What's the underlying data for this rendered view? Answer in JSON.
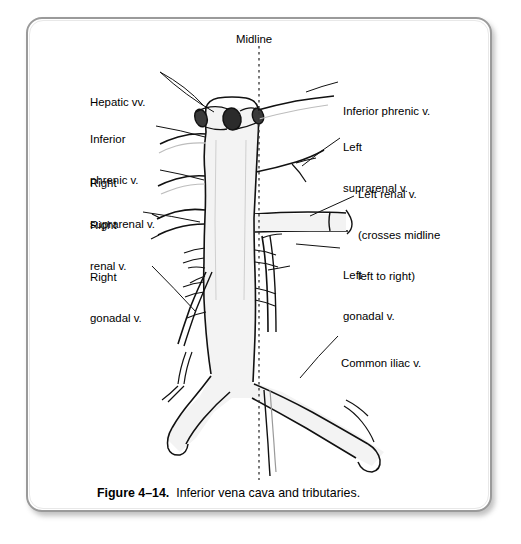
{
  "figure": {
    "caption_number": "Figure 4–14.",
    "caption_text": "Inferior vena cava and tributaries.",
    "midline_label": "Midline"
  },
  "colors": {
    "frame_border": "#9a9a9a",
    "page_background": "#ffffff",
    "ink": "#000000",
    "vessel_fill": "#f3f3f3"
  },
  "labels": {
    "left": [
      {
        "id": "hepatic-vv",
        "text": "Hepatic vv.",
        "x": 90,
        "y": 69
      },
      {
        "id": "inferior-phrenic-v-left",
        "line1": "Inferior",
        "line2": "phrenic v.",
        "x": 90,
        "y": 106
      },
      {
        "id": "right-suprarenal-v",
        "line1": "Right",
        "line2": "suprarenal v.",
        "x": 90,
        "y": 150
      },
      {
        "id": "right-renal-v",
        "line1": "Right",
        "line2": "renal v.",
        "x": 90,
        "y": 192
      },
      {
        "id": "right-gonadal-v",
        "line1": "Right",
        "line2": "gonadal v.",
        "x": 90,
        "y": 244
      }
    ],
    "right": [
      {
        "id": "inferior-phrenic-v-right",
        "text": "Inferior phrenic v.",
        "x": 343,
        "y": 78
      },
      {
        "id": "left-suprarenal-v",
        "line1": "Left",
        "line2": "suprarenal v.",
        "x": 343,
        "y": 114
      },
      {
        "id": "left-renal-v",
        "line1": "Left renal v.",
        "line2": "(crosses midline",
        "line3": "left to right)",
        "x": 358,
        "y": 161
      },
      {
        "id": "left-gonadal-v",
        "line1": "Left",
        "line2": "gonadal v.",
        "x": 343,
        "y": 242
      },
      {
        "id": "common-iliac-v",
        "text": "Common iliac v.",
        "x": 341,
        "y": 330
      }
    ]
  },
  "anatomy": {
    "structures": [
      "inferior vena cava",
      "hepatic veins",
      "right inferior phrenic vein",
      "left inferior phrenic vein",
      "right suprarenal vein",
      "left suprarenal vein",
      "right renal vein",
      "left renal vein",
      "right gonadal vein",
      "left gonadal vein",
      "lumbar veins",
      "common iliac veins",
      "median sacral vein"
    ],
    "midline_x": 259,
    "midline_y_start": 46,
    "midline_y_end": 480
  }
}
